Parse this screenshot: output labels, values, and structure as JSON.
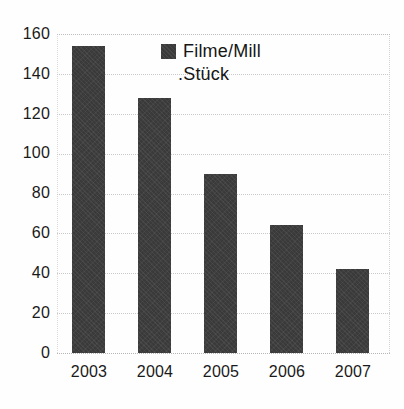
{
  "chart_data": {
    "type": "bar",
    "title": "",
    "subtitle": "",
    "xlabel": "",
    "ylabel": "",
    "categories": [
      "2003",
      "2004",
      "2005",
      "2006",
      "2007"
    ],
    "series": [
      {
        "name": "Filme/Mill .Stück",
        "values": [
          154,
          128,
          90,
          64,
          42
        ],
        "color": "#3a3a3a"
      }
    ],
    "ylim": [
      0,
      160
    ],
    "ytick_step": 20,
    "yticks": [
      0,
      20,
      40,
      60,
      80,
      100,
      120,
      140,
      160
    ],
    "ytick_labels": [
      "0",
      "20",
      "40",
      "60",
      "80",
      "100",
      "120",
      "140",
      "160"
    ],
    "grid": "horizontal-dotted",
    "legend_position": "top-center-inside",
    "annotations": []
  },
  "legend": {
    "line1": "Filme/Mill",
    "line2": ".Stück",
    "swatch_color": "#3a3a3a",
    "swatch_name": "legend-color-swatch"
  },
  "colors": {
    "bar": "#3a3a3a",
    "grid": "#c9c9c9",
    "text": "#1a1a1a",
    "background": "#ffffff"
  }
}
